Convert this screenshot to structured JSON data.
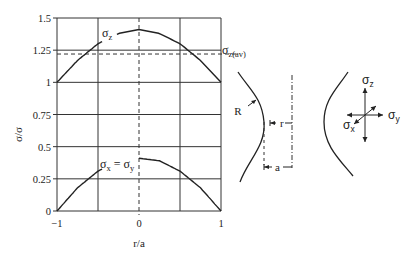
{
  "chart_data": {
    "type": "line",
    "title": "",
    "xlabel": "r/a",
    "ylabel": "σ/σ",
    "xlim": [
      -1,
      1
    ],
    "ylim": [
      0,
      1.5
    ],
    "grid": true,
    "x_ticks": [
      "−1",
      "0",
      "1"
    ],
    "x_tick_values": [
      -1,
      0,
      1
    ],
    "x_gridlines": [
      -1,
      -0.5,
      0,
      0.5,
      1
    ],
    "y_ticks": [
      "0",
      "0.25",
      "0.5",
      "0.75",
      "1",
      "1.25",
      "1.5"
    ],
    "y_tick_values": [
      0,
      0.25,
      0.5,
      0.75,
      1,
      1.25,
      1.5
    ],
    "series": [
      {
        "name": "σz",
        "label": "σ",
        "label_sub": "z",
        "x": [
          -1,
          -0.75,
          -0.5,
          -0.25,
          0,
          0.25,
          0.5,
          0.75,
          1
        ],
        "values": [
          1.0,
          1.17,
          1.3,
          1.38,
          1.41,
          1.38,
          1.3,
          1.17,
          1.0
        ]
      },
      {
        "name": "σx = σy",
        "label": "σ",
        "label_sub": "x",
        "label_mid": " = σ",
        "label_sub2": "y",
        "x": [
          -1,
          -0.75,
          -0.5,
          -0.25,
          0,
          0.25,
          0.5,
          0.75,
          1
        ],
        "values": [
          0.0,
          0.18,
          0.31,
          0.39,
          0.41,
          0.39,
          0.31,
          0.18,
          0.0
        ]
      }
    ],
    "reference_lines": [
      {
        "name": "σz(av)",
        "label": "σ",
        "label_sub": "z(av)",
        "y": 1.22,
        "style": "dashed"
      },
      {
        "name": "r=0",
        "x": 0,
        "style": "dashed"
      }
    ]
  },
  "notch_diagram": {
    "radius_label": "R",
    "r_label": "r",
    "a_label": "a"
  },
  "stress_element": {
    "z_label": "σ",
    "z_sub": "z",
    "y_label": "σ",
    "y_sub": "y",
    "x_label": "σ",
    "x_sub": "x"
  }
}
